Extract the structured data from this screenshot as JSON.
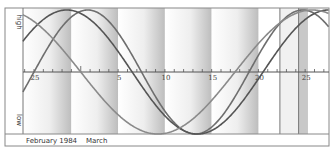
{
  "chart_data": {
    "type": "line",
    "title": "",
    "xlabel": "February 1984   March",
    "ylabel_high": "high",
    "ylabel_low": "low",
    "x_ticks": [
      {
        "label": "25",
        "day": 0
      },
      {
        "label": "5",
        "day": 9
      },
      {
        "label": "10",
        "day": 14
      },
      {
        "label": "15",
        "day": 19
      },
      {
        "label": "20",
        "day": 24
      },
      {
        "label": "25",
        "day": 29
      }
    ],
    "month_labels": [
      "February 1984",
      "March"
    ],
    "x_range_days": [
      -1.2,
      31.5
    ],
    "ylim": [
      -1,
      1
    ],
    "series": [
      {
        "name": "physical",
        "period_days": 23,
        "zero_cross_up_day": 0.0,
        "color": "#6e6e6e",
        "width": 1.6
      },
      {
        "name": "emotional",
        "period_days": 28,
        "zero_cross_up_day": -3.5,
        "color": "#555555",
        "width": 1.6
      },
      {
        "name": "intellectual",
        "period_days": 33,
        "zero_cross_up_day": -11.5,
        "color": "#8a8a8a",
        "width": 1.6
      }
    ],
    "shaded_bands_days": [
      [
        -1.2,
        4
      ],
      [
        4,
        9
      ],
      [
        9,
        14
      ],
      [
        14,
        19
      ],
      [
        19,
        24
      ]
    ],
    "markers_days": [
      26.3,
      28.3
    ],
    "marker_band_days": [
      28.3,
      29.3
    ],
    "grid": false
  }
}
